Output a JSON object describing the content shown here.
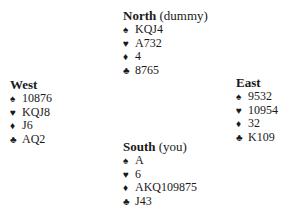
{
  "hands": {
    "north": {
      "name": "North",
      "role": "(dummy)",
      "spades": "KQJ4",
      "hearts": "A732",
      "diamonds": "4",
      "clubs": "8765"
    },
    "west": {
      "name": "West",
      "role": "",
      "spades": "10876",
      "hearts": "KQJ8",
      "diamonds": "J6",
      "clubs": "AQ2"
    },
    "east": {
      "name": "East",
      "role": "",
      "spades": "9532",
      "hearts": "10954",
      "diamonds": "32",
      "clubs": "K109"
    },
    "south": {
      "name": "South",
      "role": "(you)",
      "spades": "A",
      "hearts": "6",
      "diamonds": "AKQ109875",
      "clubs": "J43"
    }
  },
  "icons": {
    "spades": "♠",
    "hearts": "♥",
    "diamonds": "♦",
    "clubs": "♣"
  }
}
